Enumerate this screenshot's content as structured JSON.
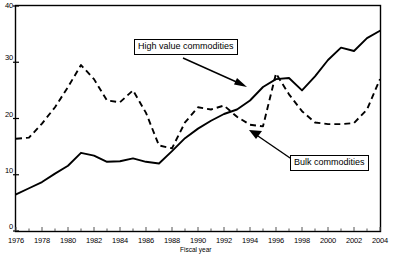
{
  "chart_data": {
    "type": "line",
    "title": "",
    "xlabel": "Fiscal year",
    "ylabel": "",
    "xlim": [
      1976,
      2004
    ],
    "ylim": [
      0,
      40
    ],
    "grid": false,
    "legend_position": "inline-callouts",
    "x": [
      1976,
      1977,
      1978,
      1979,
      1980,
      1981,
      1982,
      1983,
      1984,
      1985,
      1986,
      1987,
      1988,
      1989,
      1990,
      1991,
      1992,
      1993,
      1994,
      1995,
      1996,
      1997,
      1998,
      1999,
      2000,
      2001,
      2002,
      2003,
      2004
    ],
    "xticks": [
      "1976",
      "1978",
      "1980",
      "1982",
      "1984",
      "1986",
      "1988",
      "1990",
      "1992",
      "1994",
      "1996",
      "1998",
      "2000",
      "2002",
      "2004"
    ],
    "yticks": [
      "0",
      "10",
      "20",
      "30",
      "40"
    ],
    "series": [
      {
        "name": "High value commodities",
        "style": "solid",
        "color": "#000000",
        "values": [
          6.5,
          7.6,
          8.7,
          10.2,
          11.6,
          13.9,
          13.4,
          12.3,
          12.4,
          12.9,
          12.3,
          12.0,
          14.2,
          16.5,
          18.2,
          19.6,
          20.8,
          21.6,
          23.2,
          25.6,
          27.0,
          27.2,
          25.0,
          27.5,
          30.4,
          32.6,
          32.0,
          34.3,
          35.6
        ]
      },
      {
        "name": "Bulk commodities",
        "style": "dashed",
        "color": "#000000",
        "values": [
          16.4,
          16.6,
          19.1,
          22.0,
          25.6,
          29.5,
          27.0,
          23.2,
          22.9,
          25.0,
          21.0,
          15.2,
          14.7,
          19.3,
          22.0,
          21.6,
          22.3,
          20.3,
          18.9,
          18.6,
          28.0,
          24.3,
          21.3,
          19.3,
          19.0,
          19.0,
          19.2,
          21.6,
          27.0
        ]
      }
    ],
    "annotations": [
      {
        "name": "high-value-callout",
        "label": "High value commodities"
      },
      {
        "name": "bulk-callout",
        "label": "Bulk commodities"
      }
    ]
  },
  "labels": {
    "y": {
      "t0": "0",
      "t1": "10",
      "t2": "20",
      "t3": "30",
      "t4": "40"
    },
    "x": {
      "y1976": "1976",
      "y1978": "1978",
      "y1980": "1980",
      "y1982": "1982",
      "y1984": "1984",
      "y1986": "1986",
      "y1988": "1988",
      "y1990": "1990",
      "y1992": "1992",
      "y1994": "1994",
      "y1996": "1996",
      "y1998": "1998",
      "y2000": "2000",
      "y2002": "2002",
      "y2004": "2004"
    },
    "axis_title": "Fiscal year",
    "callout_high": "High value commodities",
    "callout_bulk": "Bulk commodities"
  }
}
